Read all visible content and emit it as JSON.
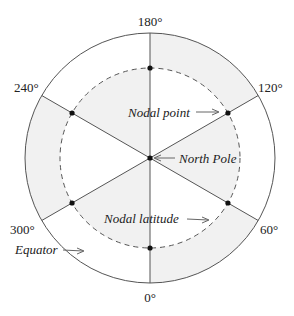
{
  "diagram": {
    "type": "polar-nodal-diagram",
    "geometry": {
      "cx": 150,
      "cy": 158,
      "outer_r": 125,
      "inner_r": 90
    },
    "colors": {
      "shade": "#f1f1f1",
      "stroke": "#555555",
      "dot": "#111111",
      "text": "#222222"
    },
    "angle_labels": [
      {
        "text": "180°",
        "deg": 180
      },
      {
        "text": "120°",
        "deg": 120
      },
      {
        "text": "60°",
        "deg": 60
      },
      {
        "text": "0°",
        "deg": 0
      },
      {
        "text": "300°",
        "deg": 300
      },
      {
        "text": "240°",
        "deg": 240
      }
    ],
    "shaded_regions": [
      {
        "sector": "0-60",
        "region": "outer"
      },
      {
        "sector": "60-120",
        "region": "inner"
      },
      {
        "sector": "120-180",
        "region": "outer"
      },
      {
        "sector": "180-240",
        "region": "inner"
      },
      {
        "sector": "240-300",
        "region": "outer"
      },
      {
        "sector": "300-360",
        "region": "inner"
      }
    ],
    "annotations": {
      "nodal_point": "Nodal point",
      "north_pole": "North Pole",
      "nodal_latitude": "Nodal latitude",
      "equator": "Equator"
    }
  }
}
